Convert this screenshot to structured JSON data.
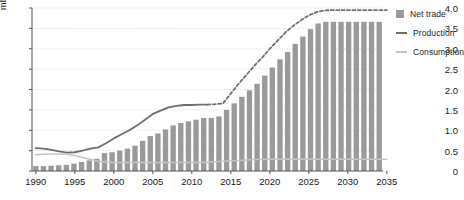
{
  "chart_data": {
    "type": "bar",
    "title": "",
    "subtitle": "",
    "xlabel": "",
    "ylabel": "mb/d",
    "ylim": [
      0,
      4.0
    ],
    "xlim": [
      1990,
      2035
    ],
    "grid": true,
    "legend_position": "top-right-outside",
    "ytick_labels": [
      "0",
      "0.5",
      "1.0",
      "1.5",
      "2.0",
      "2.5",
      "3.0",
      "3.5",
      "4.0"
    ],
    "ytick_values": [
      0,
      0.5,
      1.0,
      1.5,
      2.0,
      2.5,
      3.0,
      3.5,
      4.0
    ],
    "xtick_labels": [
      "1990",
      "1995",
      "2000",
      "2005",
      "2010",
      "2015",
      "2020",
      "2025",
      "2030",
      "2035"
    ],
    "xtick_values": [
      1990,
      1995,
      2000,
      2005,
      2010,
      2015,
      2020,
      2025,
      2030,
      2035
    ],
    "x": [
      1990,
      1991,
      1992,
      1993,
      1994,
      1995,
      1996,
      1997,
      1998,
      1999,
      2000,
      2001,
      2002,
      2003,
      2004,
      2005,
      2006,
      2007,
      2008,
      2009,
      2010,
      2011,
      2012,
      2013,
      2014,
      2015,
      2016,
      2017,
      2018,
      2019,
      2020,
      2021,
      2022,
      2023,
      2024,
      2025,
      2026,
      2027,
      2028,
      2029,
      2030,
      2031,
      2032,
      2033,
      2034,
      2035
    ],
    "forecast_start_year": 2012,
    "series": [
      {
        "name": "Net trade",
        "render": "bar",
        "color": "#9a9a9a",
        "values": [
          0.12,
          0.12,
          0.13,
          0.14,
          0.15,
          0.18,
          0.22,
          0.26,
          0.3,
          0.44,
          0.46,
          0.5,
          0.55,
          0.62,
          0.74,
          0.86,
          0.92,
          1.02,
          1.12,
          1.18,
          1.22,
          1.26,
          1.3,
          1.3,
          1.34,
          1.5,
          1.66,
          1.82,
          1.98,
          2.14,
          2.34,
          2.54,
          2.74,
          2.92,
          3.12,
          3.3,
          3.48,
          3.62,
          3.66,
          3.66,
          3.66,
          3.66,
          3.66,
          3.66,
          3.66,
          3.66
        ]
      },
      {
        "name": "Production",
        "render": "line",
        "color": "#6e6e6e",
        "values": [
          0.56,
          0.55,
          0.52,
          0.48,
          0.45,
          0.46,
          0.5,
          0.55,
          0.58,
          0.68,
          0.8,
          0.9,
          1.0,
          1.12,
          1.26,
          1.4,
          1.48,
          1.56,
          1.6,
          1.62,
          1.62,
          1.63,
          1.63,
          1.64,
          1.66,
          1.9,
          2.14,
          2.36,
          2.58,
          2.78,
          3.0,
          3.2,
          3.4,
          3.56,
          3.7,
          3.82,
          3.9,
          3.94,
          3.95,
          3.95,
          3.95,
          3.95,
          3.95,
          3.95,
          3.95,
          3.95
        ]
      },
      {
        "name": "Consumption",
        "render": "line",
        "color": "#c4c4c4",
        "values": [
          0.4,
          0.41,
          0.42,
          0.42,
          0.41,
          0.38,
          0.33,
          0.28,
          0.24,
          0.22,
          0.21,
          0.21,
          0.21,
          0.21,
          0.21,
          0.21,
          0.21,
          0.21,
          0.21,
          0.21,
          0.21,
          0.21,
          0.22,
          0.23,
          0.24,
          0.25,
          0.26,
          0.27,
          0.28,
          0.28,
          0.29,
          0.29,
          0.29,
          0.29,
          0.29,
          0.29,
          0.29,
          0.29,
          0.29,
          0.29,
          0.29,
          0.29,
          0.29,
          0.29,
          0.29,
          0.29
        ]
      }
    ]
  },
  "legend": {
    "items": [
      {
        "label": "Net trade",
        "swatch": "bar",
        "color": "#9a9a9a"
      },
      {
        "label": "Production",
        "swatch": "line",
        "color": "#6e6e6e"
      },
      {
        "label": "Consumption",
        "swatch": "line",
        "color": "#c4c4c4"
      }
    ]
  },
  "colors": {
    "bar": "#9a9a9a",
    "production": "#6e6e6e",
    "consumption": "#c4c4c4",
    "axis": "#555555",
    "grid": "#cfcfcf",
    "text": "#1a1a1a"
  }
}
